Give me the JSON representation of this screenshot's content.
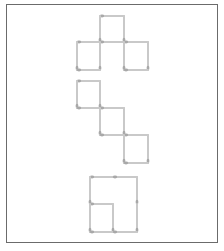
{
  "colors": {
    "stick": "#c9c9c9",
    "head": "#a8a8a8",
    "frame": "#6b6b6b"
  },
  "figures": [
    {
      "name": "t-shape-three-squares",
      "sticks": [
        [
          100,
          16,
          124,
          16
        ],
        [
          100,
          16,
          100,
          42
        ],
        [
          124,
          16,
          124,
          42
        ],
        [
          77,
          42,
          100,
          42
        ],
        [
          100,
          42,
          124,
          42
        ],
        [
          124,
          42,
          148,
          42
        ],
        [
          77,
          42,
          77,
          70
        ],
        [
          100,
          42,
          100,
          70
        ],
        [
          124,
          42,
          124,
          70
        ],
        [
          148,
          42,
          148,
          70
        ],
        [
          77,
          70,
          100,
          70
        ],
        [
          124,
          70,
          148,
          70
        ]
      ]
    },
    {
      "name": "diagonal-staircase-three-squares",
      "sticks": [
        [
          77,
          81,
          100,
          81
        ],
        [
          77,
          81,
          77,
          108
        ],
        [
          100,
          81,
          100,
          108
        ],
        [
          77,
          108,
          100,
          108
        ],
        [
          100,
          108,
          124,
          108
        ],
        [
          100,
          108,
          100,
          135
        ],
        [
          124,
          108,
          124,
          135
        ],
        [
          100,
          135,
          124,
          135
        ],
        [
          124,
          135,
          148,
          135
        ],
        [
          124,
          135,
          124,
          163
        ],
        [
          148,
          135,
          148,
          163
        ],
        [
          124,
          163,
          148,
          163
        ]
      ]
    },
    {
      "name": "square-with-inner-square",
      "sticks": [
        [
          90,
          177,
          113,
          177
        ],
        [
          113,
          177,
          137,
          177
        ],
        [
          90,
          177,
          90,
          204
        ],
        [
          137,
          177,
          137,
          204
        ],
        [
          90,
          204,
          113,
          204
        ],
        [
          90,
          204,
          90,
          232
        ],
        [
          113,
          204,
          113,
          232
        ],
        [
          137,
          204,
          137,
          232
        ],
        [
          90,
          232,
          113,
          232
        ],
        [
          113,
          232,
          137,
          232
        ]
      ]
    }
  ]
}
